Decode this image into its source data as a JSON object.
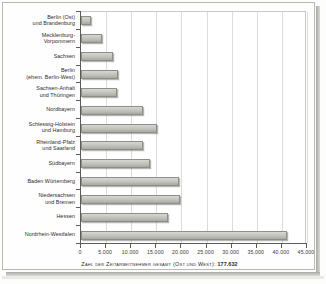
{
  "chart_data": {
    "type": "bar",
    "orientation": "horizontal",
    "title": "",
    "xlabel": "Zahl der Zeitarbeitnehmer gesamt (Ost und West): 177.632",
    "ylabel": "",
    "xlim": [
      0,
      45000
    ],
    "grid": true,
    "legend": false,
    "xticks": [
      0,
      5000,
      10000,
      15000,
      20000,
      25000,
      30000,
      35000,
      40000,
      45000
    ],
    "xticklabels": [
      "0",
      "5.000",
      "10.000",
      "15.000",
      "20.000",
      "25.000",
      "30.000",
      "35.000",
      "40.000",
      "45.000"
    ],
    "categories": [
      "Berlin (Ost) und Brandenburg",
      "Mecklenburg-Vorpommern",
      "Sachsen",
      "Berlin (ehem. Berlin-West)",
      "Sachsen-Anhalt und Thüringen",
      "Nordbayern",
      "Schleswig-Holstein und Hamburg",
      "Rheinland-Pfalz und Saarland",
      "Südbayern",
      "Baden Würtemberg",
      "Niedersachsen und Bremen",
      "Hessen",
      "Nordrhein-Westfalen"
    ],
    "category_lines": [
      [
        "Berlin (Ost)",
        "und Brandenburg"
      ],
      [
        "Mecklenburg-",
        "Vorpommern"
      ],
      [
        "Sachsen"
      ],
      [
        "Berlin",
        "(ehem. Berlin-West)"
      ],
      [
        "Sachsen-Anhalt",
        "und Thüringen"
      ],
      [
        "Nordbayern"
      ],
      [
        "Schleswig-Holstein",
        "und Hamburg"
      ],
      [
        "Rheinland-Pfalz",
        "und Saarland"
      ],
      [
        "Südbayern"
      ],
      [
        "Baden Würtemberg"
      ],
      [
        "Niedersachsen",
        "und Bremen"
      ],
      [
        "Hessen"
      ],
      [
        "Nordrhein-Westfalen"
      ]
    ],
    "values": [
      2000,
      4100,
      6300,
      7300,
      7200,
      12400,
      15200,
      12300,
      13700,
      19500,
      19800,
      17400,
      41000
    ],
    "total": "177.632",
    "caption_prefix": "Zahl der Zeitarbeitnehmer gesamt (Ost und West):"
  },
  "colors": {
    "bar_fill": "#c6c6c1",
    "bar_edge": "#8e8e89",
    "axis": "#5b5b58",
    "grid": "#dcdcd8",
    "text": "#2e2e2c",
    "plate_bg": "#fefefe",
    "page_bg": "#fdfdfc"
  }
}
